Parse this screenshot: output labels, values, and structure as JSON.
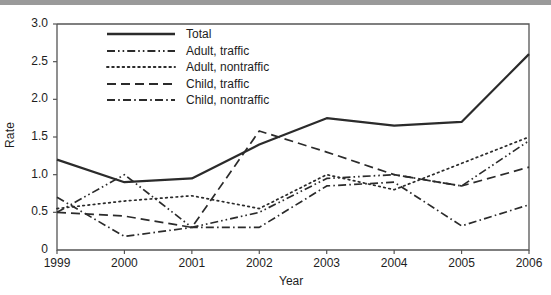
{
  "chart_data": {
    "type": "line",
    "title": "",
    "xlabel": "Year",
    "ylabel": "Rate",
    "grid": false,
    "legend_position": "top-left-inside",
    "categories": [
      1999,
      2000,
      2001,
      2002,
      2003,
      2004,
      2005,
      2006
    ],
    "x_tick_labels": [
      "1999",
      "2000",
      "2001",
      "2002",
      "2003",
      "2004",
      "2005",
      "2006"
    ],
    "y_tick_labels": [
      "0",
      "0.5",
      "1.0",
      "1.5",
      "2.0",
      "2.5",
      "3.0"
    ],
    "y_tick_values": [
      0,
      0.5,
      1.0,
      1.5,
      2.0,
      2.5,
      3.0
    ],
    "xlim": [
      1999,
      2006
    ],
    "ylim": [
      0,
      3.0
    ],
    "series": [
      {
        "name": "Total",
        "style": "solid",
        "values": [
          1.2,
          0.9,
          0.95,
          1.4,
          1.75,
          1.65,
          1.7,
          2.6
        ]
      },
      {
        "name": "Adult, traffic",
        "style": "dash-dot-dot",
        "values": [
          0.5,
          1.0,
          0.3,
          0.5,
          0.95,
          1.0,
          0.85,
          1.45
        ]
      },
      {
        "name": "Adult, nontraffic",
        "style": "dotted",
        "values": [
          0.55,
          0.65,
          0.72,
          0.55,
          1.0,
          0.8,
          1.15,
          1.5
        ]
      },
      {
        "name": "Child, traffic",
        "style": "dashed",
        "values": [
          0.5,
          0.45,
          0.3,
          1.58,
          1.3,
          1.0,
          0.85,
          1.1
        ]
      },
      {
        "name": "Child, nontraffic",
        "style": "dash-dot",
        "values": [
          0.7,
          0.18,
          0.3,
          0.3,
          0.85,
          0.9,
          0.32,
          0.6
        ]
      }
    ]
  },
  "legend": {
    "items": [
      {
        "label": "Total"
      },
      {
        "label": "Adult, traffic"
      },
      {
        "label": "Adult, nontraffic"
      },
      {
        "label": "Child, traffic"
      },
      {
        "label": "Child, nontraffic"
      }
    ]
  },
  "colors": {
    "line": "#2b2b2b",
    "axis": "#555555",
    "text": "#1d1d1d",
    "topbar": "#9a9a9a"
  }
}
